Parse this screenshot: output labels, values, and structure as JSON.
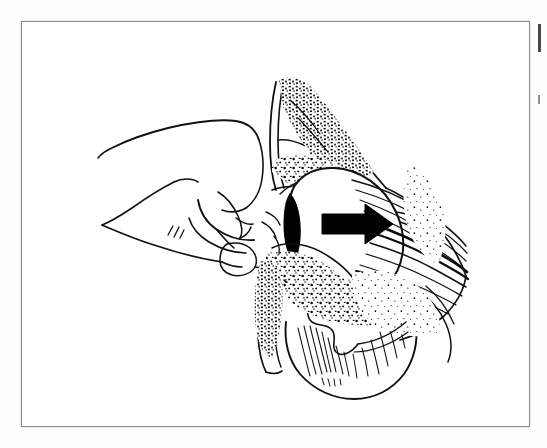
{
  "page": {
    "background_color": "#fdfdfd",
    "width": 547,
    "height": 448
  },
  "figure": {
    "frame": {
      "border_color": "#8d8d8f",
      "fill_color": "#ffffff",
      "x": 21,
      "y": 21,
      "width": 509,
      "height": 406
    },
    "caption": "",
    "alt_text": "Line drawing cross-section of a hip joint: an examiner's hand with thumb and index finger pressing on the anterior joint region, with a solid black arrow pointing to the right indicating the direction of applied force on the femoral head."
  },
  "illustration": {
    "title": "Hip joint cross-section with manual pressure",
    "style": "black ink line art, stippled trabecular bone, white background",
    "line_color": "#111111",
    "fill_color": "#ffffff",
    "elements": [
      {
        "name": "examiner-hand",
        "label": "Examiner's hand / closed fist",
        "description": "Clenched hand seen from the ulnar side, index finger extended and thumb folded, pressing against the joint capsule."
      },
      {
        "name": "index-finger",
        "label": "Index finger",
        "description": "Finger tip contacting the anterior joint line."
      },
      {
        "name": "thumb",
        "label": "Thumb",
        "description": "Thumb nail visible at lower right of the fist."
      },
      {
        "name": "acetabulum",
        "label": "Acetabulum",
        "description": "Upper cup-shaped socket with stippled cancellous bone."
      },
      {
        "name": "femoral-head",
        "label": "Femoral head",
        "description": "Large rounded white ball seated in the socket."
      },
      {
        "name": "acetabular-labrum",
        "label": "Acetabular labrum",
        "description": "Solid black almond-shaped wedge at the anterior rim."
      },
      {
        "name": "joint-capsule",
        "label": "Joint capsule / ligaments",
        "description": "Layered fibrous bands sweeping to the right."
      },
      {
        "name": "greater-trochanter",
        "label": "Greater trochanter / femoral neck",
        "description": "Lower bony mass with trabecular stippling and hatching."
      },
      {
        "name": "cortical-bone",
        "label": "Cortical bone outline",
        "description": "Double-line bone cortex borders."
      },
      {
        "name": "direction-arrow",
        "label": "Direction of force",
        "description": "Solid black arrow pointing right, centered on the femoral head."
      }
    ]
  },
  "arrow": {
    "name": "direction-arrow",
    "color": "#000000",
    "direction": "right",
    "meaning": "Direction of applied force"
  },
  "margin": {
    "cutoff_text": "",
    "note": "Sliver of adjacent page text cropped at right edge"
  }
}
